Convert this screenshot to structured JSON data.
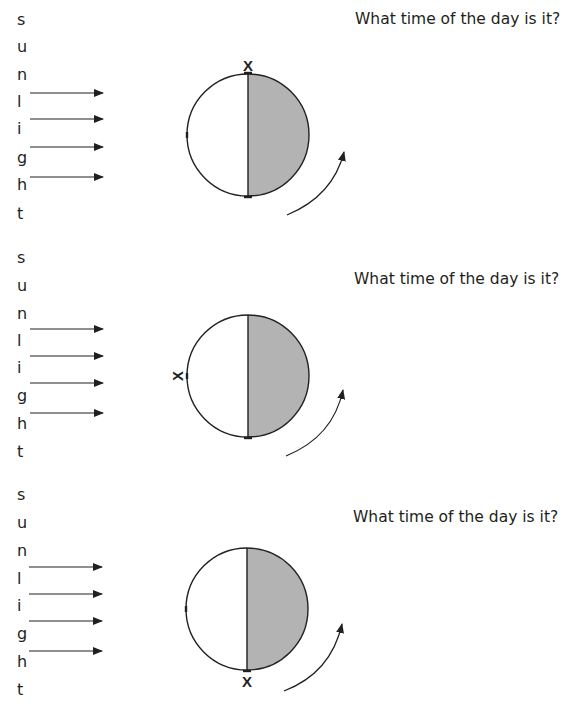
{
  "colors": {
    "ink": "#231f20",
    "night_side": "#b3b3b3",
    "day_side": "#ffffff"
  },
  "sunlight_label_letters": [
    "s",
    "u",
    "n",
    "l",
    "i",
    "g",
    "h",
    "t"
  ],
  "panels": [
    {
      "question": "What time of the day is it?",
      "marker_label": "X",
      "marker_position": "top"
    },
    {
      "question": "What time of the day is it?",
      "marker_label": "X",
      "marker_position": "left"
    },
    {
      "question": "What time of the day is it?",
      "marker_label": "X",
      "marker_position": "bottom"
    }
  ]
}
